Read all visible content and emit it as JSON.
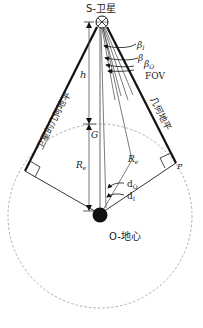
{
  "diagram": {
    "satellite_label": "S-卫星",
    "earth_center_label": "O-地心",
    "left_horizon_label": "卫星的几何地平",
    "right_horizon_label": "几何地平",
    "height_label": "h",
    "ground_point_label": "G",
    "earth_radius_label_left": "Re",
    "earth_radius_label_right": "Re",
    "tangent_point_label": "P",
    "angle_labels": {
      "beta_I": "βI",
      "beta": "β",
      "beta_O": "βO",
      "fov": "FOV",
      "d_O": "dO",
      "d_I": "dI"
    },
    "colors": {
      "line": "#111111",
      "thin_line": "#555555",
      "dashed_circle": "#999999"
    }
  }
}
